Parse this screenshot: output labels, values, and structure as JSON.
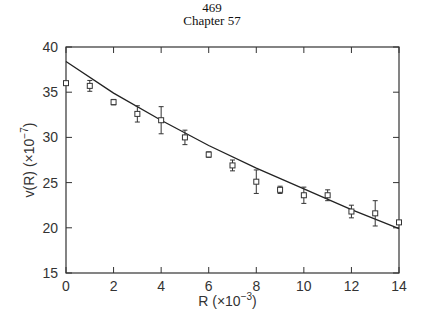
{
  "header": {
    "page_number": "469",
    "chapter": "Chapter 57"
  },
  "chart_data": {
    "type": "scatter",
    "title": "",
    "xlabel": "R (×10⁻³)",
    "ylabel": "v(R) (×10⁻⁷)",
    "xlim": [
      0,
      14
    ],
    "ylim": [
      15,
      40
    ],
    "xticks": [
      0,
      2,
      4,
      6,
      8,
      10,
      12,
      14
    ],
    "yticks": [
      15,
      20,
      25,
      30,
      35,
      40
    ],
    "grid": false,
    "series": [
      {
        "name": "measured",
        "marker": "open-square",
        "x": [
          0,
          1,
          2,
          3,
          4,
          5,
          6,
          7,
          8,
          9,
          10,
          11,
          12,
          13,
          14
        ],
        "y": [
          36.0,
          35.7,
          33.9,
          32.6,
          31.9,
          30.0,
          28.1,
          26.9,
          25.1,
          24.2,
          23.6,
          23.6,
          21.8,
          21.6,
          20.6
        ],
        "err": [
          0.2,
          0.6,
          0.3,
          0.9,
          1.5,
          0.8,
          0.3,
          0.6,
          1.3,
          0.4,
          0.9,
          0.6,
          0.7,
          1.4,
          0.2
        ]
      },
      {
        "name": "fit",
        "type": "line",
        "x": [
          0,
          2,
          4,
          6,
          8,
          10,
          12,
          14
        ],
        "y": [
          38.4,
          34.9,
          31.9,
          29.1,
          26.6,
          24.3,
          22.0,
          19.9
        ]
      }
    ]
  },
  "axes": {
    "x_title": "R",
    "x_unit": "(×10",
    "x_exp": "−3",
    "x_close": ")",
    "y_title": "v(R)",
    "y_unit": "(×10",
    "y_exp": "−7",
    "y_close": ")"
  }
}
